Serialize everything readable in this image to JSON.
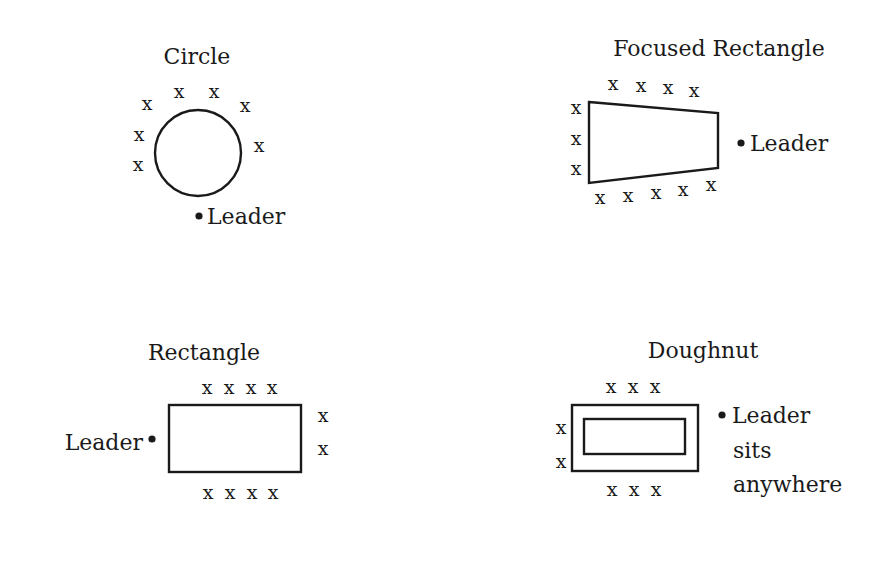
{
  "diagrams": {
    "circle": {
      "title": "Circle",
      "leader_label": "Leader",
      "marks": [
        {
          "x": 147,
          "y": 110,
          "t": "x"
        },
        {
          "x": 179,
          "y": 98,
          "t": "x"
        },
        {
          "x": 214,
          "y": 98,
          "t": "x"
        },
        {
          "x": 245,
          "y": 112,
          "t": "x"
        },
        {
          "x": 139,
          "y": 141,
          "t": "x"
        },
        {
          "x": 259,
          "y": 152,
          "t": "x"
        },
        {
          "x": 138,
          "y": 171,
          "t": "x"
        }
      ]
    },
    "focused_rectangle": {
      "title": "Focused Rectangle",
      "leader_label": "Leader",
      "marks": [
        {
          "x": 613,
          "y": 90,
          "t": "x"
        },
        {
          "x": 641,
          "y": 92,
          "t": "x"
        },
        {
          "x": 668,
          "y": 94,
          "t": "x"
        },
        {
          "x": 694,
          "y": 97,
          "t": "x"
        },
        {
          "x": 576,
          "y": 114,
          "t": "x"
        },
        {
          "x": 576,
          "y": 145,
          "t": "x"
        },
        {
          "x": 576,
          "y": 175,
          "t": "x"
        },
        {
          "x": 600,
          "y": 204,
          "t": "x"
        },
        {
          "x": 628,
          "y": 202,
          "t": "x"
        },
        {
          "x": 656,
          "y": 199,
          "t": "x"
        },
        {
          "x": 683,
          "y": 196,
          "t": "x"
        },
        {
          "x": 711,
          "y": 191,
          "t": "x"
        }
      ]
    },
    "rectangle": {
      "title": "Rectangle",
      "leader_label": "Leader",
      "marks": [
        {
          "x": 207,
          "y": 394,
          "t": "x"
        },
        {
          "x": 229,
          "y": 394,
          "t": "x"
        },
        {
          "x": 251,
          "y": 394,
          "t": "x"
        },
        {
          "x": 272,
          "y": 394,
          "t": "x"
        },
        {
          "x": 323,
          "y": 422,
          "t": "x"
        },
        {
          "x": 323,
          "y": 455,
          "t": "x"
        },
        {
          "x": 208,
          "y": 499,
          "t": "x"
        },
        {
          "x": 230,
          "y": 499,
          "t": "x"
        },
        {
          "x": 252,
          "y": 499,
          "t": "x"
        },
        {
          "x": 273,
          "y": 499,
          "t": "x"
        }
      ]
    },
    "doughnut": {
      "title": "Doughnut",
      "leader_label_lines": [
        "Leader",
        "sits",
        "anywhere"
      ],
      "marks": [
        {
          "x": 611,
          "y": 393,
          "t": "x"
        },
        {
          "x": 633,
          "y": 393,
          "t": "x"
        },
        {
          "x": 655,
          "y": 393,
          "t": "x"
        },
        {
          "x": 561,
          "y": 434,
          "t": "x"
        },
        {
          "x": 561,
          "y": 468,
          "t": "x"
        },
        {
          "x": 612,
          "y": 496,
          "t": "x"
        },
        {
          "x": 634,
          "y": 496,
          "t": "x"
        },
        {
          "x": 656,
          "y": 496,
          "t": "x"
        }
      ]
    }
  }
}
